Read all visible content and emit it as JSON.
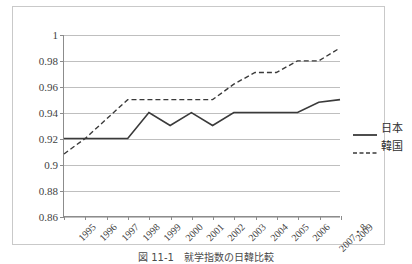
{
  "chart_data": {
    "type": "line",
    "title": "",
    "xlabel": "",
    "ylabel": "",
    "ylim": [
      0.86,
      1
    ],
    "ytick_step": 0.02,
    "grid": true,
    "legend_position": "right",
    "categories": [
      "1995",
      "1996",
      "1997",
      "1998",
      "1999",
      "2000",
      "2001",
      "2002",
      "2003",
      "2004",
      "2005",
      "2006",
      "2007・8",
      "2009"
    ],
    "ytick_labels": [
      "1",
      "0.98",
      "0.96",
      "0.94",
      "0.92",
      "0.9",
      "0.88",
      "0.86"
    ],
    "ytick_values": [
      1,
      0.98,
      0.96,
      0.94,
      0.92,
      0.9,
      0.88,
      0.86
    ],
    "series": [
      {
        "name": "日本",
        "style": "solid",
        "color": "#3a3a3a",
        "values": [
          0.92,
          0.92,
          0.92,
          0.92,
          0.94,
          0.93,
          0.94,
          0.93,
          0.94,
          0.94,
          0.94,
          0.94,
          0.948,
          0.95
        ]
      },
      {
        "name": "韓国",
        "style": "dashed",
        "color": "#3a3a3a",
        "values": [
          0.908,
          0.92,
          0.935,
          0.95,
          0.95,
          0.95,
          0.95,
          0.95,
          0.962,
          0.971,
          0.971,
          0.98,
          0.98,
          0.99
        ]
      }
    ]
  },
  "legend": {
    "items": [
      {
        "label": "日本",
        "style": "solid"
      },
      {
        "label": "韓国",
        "style": "dashed"
      }
    ]
  },
  "caption": {
    "text": "図 11-1　就学指数の日韓比較"
  }
}
